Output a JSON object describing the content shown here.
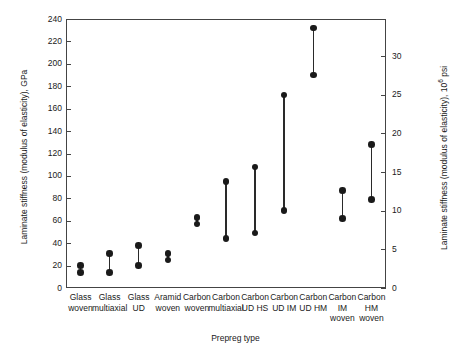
{
  "chart_data": {
    "type": "scatter",
    "title": "",
    "xlabel": "Prepreg type",
    "ylabel": "Laminate stiffness (modulus of elasticity), GPa",
    "ylabel_right": "Laminate stiffness (modulus of elasticity), 10",
    "ylabel_right_sup": "6",
    "ylabel_right_unit": " psi",
    "ylim": [
      0,
      240
    ],
    "ylim_right": [
      0,
      34.81
    ],
    "yticks": [
      0,
      20,
      40,
      60,
      80,
      100,
      120,
      140,
      160,
      180,
      200,
      220,
      240
    ],
    "yticks_right": [
      0,
      5,
      10,
      15,
      20,
      25,
      30
    ],
    "grid": false,
    "legend": "none",
    "marker": "filled-circle",
    "series_note": "Each category shows a low and high laminate stiffness value joined by a vertical bar",
    "categories": [
      "Glass woven",
      "Glass multiaxial",
      "Glass UD",
      "Aramid woven",
      "Carbon woven",
      "Carbon multiaxial",
      "Carbon UD HS",
      "Carbon UD IM",
      "Carbon UD HM",
      "Carbon IM woven",
      "Carbon HM woven"
    ],
    "category_lines": [
      [
        "Glass",
        "woven"
      ],
      [
        "Glass",
        "multiaxial"
      ],
      [
        "Glass",
        "UD"
      ],
      [
        "Aramid",
        "woven"
      ],
      [
        "Carbon",
        "woven"
      ],
      [
        "Carbon",
        "multiaxial"
      ],
      [
        "Carbon",
        "UD HS"
      ],
      [
        "Carbon",
        "UD IM"
      ],
      [
        "Carbon",
        "UD HM"
      ],
      [
        "Carbon",
        "IM",
        "woven"
      ],
      [
        "Carbon",
        "HM",
        "woven"
      ]
    ],
    "series": [
      {
        "name": "Low value, GPa",
        "values": [
          14,
          14,
          20,
          25,
          57,
          44,
          49,
          69,
          190,
          62,
          79
        ]
      },
      {
        "name": "High value, GPa",
        "values": [
          20,
          31,
          38,
          31,
          63,
          95,
          108,
          172,
          232,
          87,
          128
        ]
      }
    ]
  }
}
